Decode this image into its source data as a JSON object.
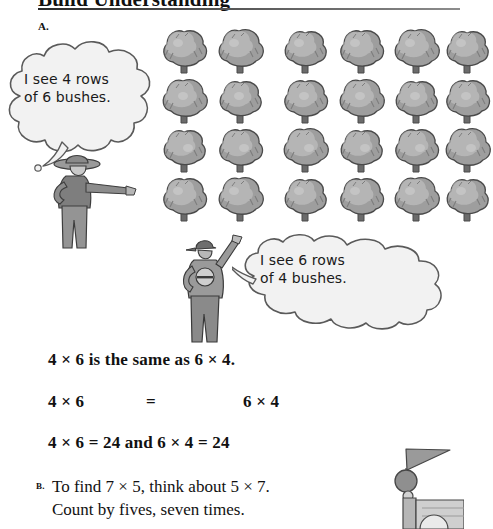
{
  "header": {
    "title": "Build Understanding",
    "rule": "horizontal-rule"
  },
  "sections": {
    "a_label": "A.",
    "b_label": "B."
  },
  "illustration": {
    "bush_grid": {
      "rows": 4,
      "columns": 6,
      "total_visible": 24,
      "item_name": "bush",
      "colors": {
        "fill_light": "#c9c9c9",
        "fill_mid": "#9e9e9e",
        "fill_dark": "#7d7d7d",
        "outline": "#4a4a4a",
        "trunk": "#6b6b6b"
      }
    },
    "farmer": {
      "name": "farmer-pointing",
      "colors": {
        "body": "#8e8e8e",
        "shade": "#6f6f6f",
        "outline": "#3c3c3c"
      }
    },
    "boy": {
      "name": "boy-with-jacket",
      "colors": {
        "body": "#9a9a9a",
        "shade": "#737373",
        "outline": "#3c3c3c"
      }
    },
    "flag_post": {
      "name": "flag-on-post",
      "colors": {
        "flag": "#9a9a9a",
        "ball": "#8a8a8a",
        "post": "#b0b0b0",
        "outline": "#4a4a4a"
      }
    }
  },
  "speech_bubbles": [
    {
      "id": "bubble-farmer",
      "speaker": "farmer",
      "text": "I see 4 rows\nof 6 bushes.",
      "line1": "I see 4 rows",
      "line2": "of 6 bushes."
    },
    {
      "id": "bubble-boy",
      "speaker": "boy",
      "text": "I see 6 rows\nof 4 bushes.",
      "line1": "I see 6 rows",
      "line2": "of 4 bushes."
    }
  ],
  "equations": {
    "line1": "4 × 6 is the same as 6 × 4.",
    "line2_left": "4 × 6",
    "line2_equals": "=",
    "line2_right": "6 × 4",
    "line3": "4 × 6 = 24 and 6 × 4 = 24"
  },
  "section_b": {
    "text": "To find 7 × 5, think about 5 × 7.\nCount by fives, seven times.",
    "line1": "To find 7 × 5, think about 5 × 7.",
    "line2": "Count by fives, seven times."
  }
}
